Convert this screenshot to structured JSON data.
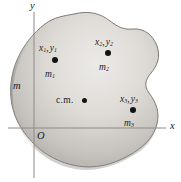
{
  "figure": {
    "caption_type": "center-of-mass-diagram",
    "body_mass_label": "m",
    "center_of_mass_label": "c.m.",
    "origin_label": "O",
    "axes": {
      "x_label": "x",
      "y_label": "y"
    },
    "colors": {
      "body_fill_light": "#e3e1de",
      "body_fill_mid": "#c9c6c2",
      "body_fill_dark": "#9d9a96",
      "outline": "#6f6c68",
      "axis": "#8d8a87",
      "marker": "#121212",
      "text": "#1b1b1b",
      "background": "#ffffff"
    },
    "particles": [
      {
        "id": "m1",
        "coord_label": "x₁, y₁",
        "coord_x_symbol": "x",
        "coord_x_sub": "1",
        "coord_y_symbol": "y",
        "coord_y_sub": "1",
        "mass_symbol": "m",
        "mass_sub": "1",
        "dot_x": 55,
        "dot_y": 60
      },
      {
        "id": "m2",
        "coord_label": "x₂, y₂",
        "coord_x_symbol": "x",
        "coord_x_sub": "2",
        "coord_y_symbol": "y",
        "coord_y_sub": "2",
        "mass_symbol": "m",
        "mass_sub": "2",
        "dot_x": 108,
        "dot_y": 53
      },
      {
        "id": "m3",
        "coord_label": "x₃, y₃",
        "coord_x_symbol": "x",
        "coord_x_sub": "3",
        "coord_y_symbol": "y",
        "coord_y_sub": "3",
        "mass_symbol": "m",
        "mass_sub": "3",
        "dot_x": 133,
        "dot_y": 110
      }
    ],
    "center_of_mass": {
      "dot_x": 84,
      "dot_y": 100
    }
  }
}
